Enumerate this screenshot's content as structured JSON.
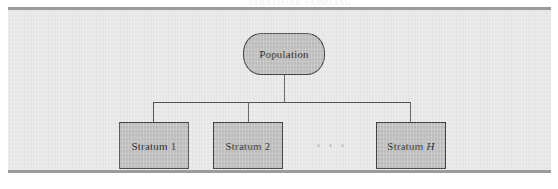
{
  "figure": {
    "type": "hierarchy-diagram",
    "caption_strip_text": "STRATIFIED SAMPLING",
    "panel_background": "#e9e9e9",
    "node_fill": "#bfbfbf",
    "node_border": "#3a3a3a",
    "connector_color": "#4a4a4a",
    "rule_color": "#9b9b9b"
  },
  "diagram_data": {
    "root": {
      "id": "population",
      "label": "Population",
      "shape": "rounded-rectangle"
    },
    "children": [
      {
        "id": "stratum-1",
        "label_prefix": "Stratum",
        "label_suffix": "1",
        "suffix_italic": false,
        "shape": "rectangle"
      },
      {
        "id": "stratum-2",
        "label_prefix": "Stratum",
        "label_suffix": "2",
        "suffix_italic": false,
        "shape": "rectangle"
      },
      {
        "id": "stratum-h",
        "label_prefix": "Stratum",
        "label_suffix": "H",
        "suffix_italic": true,
        "shape": "rectangle"
      }
    ],
    "ellipsis": {
      "label": "...",
      "between": [
        "stratum-2",
        "stratum-h"
      ],
      "dot_count": 3
    },
    "edges": [
      {
        "from": "population",
        "to": "stratum-1"
      },
      {
        "from": "population",
        "to": "stratum-2"
      },
      {
        "from": "population",
        "to": "stratum-h"
      }
    ]
  }
}
